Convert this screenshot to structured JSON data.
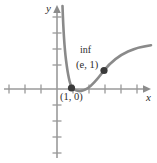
{
  "figure": {
    "name": "cartesian-graph",
    "width": 157,
    "height": 163,
    "background": "#ffffff"
  },
  "axes": {
    "x_label": "x",
    "y_label": "y",
    "origin": {
      "x": 57,
      "y": 89
    },
    "x_axis": {
      "start_x": 4,
      "end_x": 150,
      "y": 89
    },
    "y_axis": {
      "x": 57,
      "start_y": 158,
      "end_y": 7
    },
    "tick_spacing": 16,
    "x_ticks": [
      9,
      25,
      41,
      73,
      89,
      105,
      121,
      137
    ],
    "y_ticks": [
      17,
      33,
      49,
      65,
      105,
      121,
      137,
      153
    ],
    "axis_color": "#8c8c8c",
    "tick_color": "#9a9a9a"
  },
  "curve": {
    "color": "#8a8a8a",
    "width": 2.6,
    "description": "steeply decreasing branch from upper left near vertical asymptote, minimum, then rising and flattening to the right",
    "path": "M 62.5,6 C 63.2,26 64.0,44 66.0,60 C 68.0,76 69.5,84 72.0,87.5 C 76.0,92 82.0,92 88.0,88 C 94.0,84 99.0,77 104.0,70.5 C 110.0,63 118.0,56 128.0,51.5 C 136.0,48 144.0,46 151.0,45.2"
  },
  "points": [
    {
      "name": "x-intercept",
      "label": "(1, 0)",
      "cx": 71.5,
      "cy": 88.0,
      "r": 3.6,
      "color": "#3a3a3a"
    },
    {
      "name": "inflection-point",
      "label": "(e, 1)",
      "note": "inf",
      "cx": 104.0,
      "cy": 70.5,
      "r": 3.6,
      "color": "#3a3a3a"
    }
  ],
  "annotations": {
    "inflection_note": "inf",
    "inflection_coords": "(e, 1)",
    "intercept_coords": "(1, 0)"
  },
  "colors": {
    "curve": "#8a8a8a",
    "axis": "#8c8c8c",
    "point": "#3a3a3a",
    "text": "#2b2b2b",
    "background": "#ffffff"
  }
}
